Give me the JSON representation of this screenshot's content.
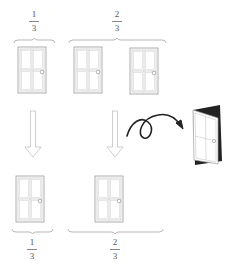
{
  "diagram": {
    "topic": "Monty Hall problem",
    "top_row": {
      "groups": [
        {
          "label_num": "1",
          "label_den": "3",
          "doors": 1
        },
        {
          "label_num": "2",
          "label_den": "3",
          "doors": 2
        }
      ]
    },
    "bottom_row": {
      "groups": [
        {
          "label_num": "1",
          "label_den": "3",
          "doors": 1
        },
        {
          "label_num": "2",
          "label_den": "3",
          "doors": 1
        }
      ]
    },
    "arrows": [
      "down-arrow-left",
      "down-arrow-middle",
      "curly-arrow-to-open-door"
    ],
    "open_door": "opened-door-icon",
    "colors": {
      "line": "#9a9a9a",
      "dark": "#222222",
      "text": "#555555"
    }
  }
}
